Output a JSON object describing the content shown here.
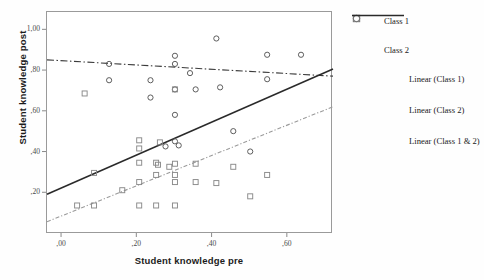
{
  "chart_data": {
    "type": "scatter",
    "title": "",
    "xlabel": "Student knowledge pre",
    "ylabel": "Student knowledge post",
    "xlim": [
      -0.04,
      0.72
    ],
    "ylim": [
      0.0,
      1.09
    ],
    "xticks": [
      ",00",
      ",20",
      ",40",
      ",60"
    ],
    "xtick_values": [
      0.0,
      0.2,
      0.4,
      0.6
    ],
    "yticks": [
      "1,00",
      ",80",
      ",60",
      ",40",
      ",20"
    ],
    "ytick_values": [
      1.0,
      0.8,
      0.6,
      0.4,
      0.2
    ],
    "grid": false,
    "legend_position": "right",
    "series": [
      {
        "name": "Class 1",
        "marker": "circle",
        "color": "#555555",
        "points": [
          [
            0.125,
            0.835
          ],
          [
            0.125,
            0.755
          ],
          [
            0.235,
            0.755
          ],
          [
            0.235,
            0.67
          ],
          [
            0.3,
            0.875
          ],
          [
            0.3,
            0.835
          ],
          [
            0.3,
            0.71
          ],
          [
            0.3,
            0.585
          ],
          [
            0.3,
            0.455
          ],
          [
            0.31,
            0.435
          ],
          [
            0.34,
            0.79
          ],
          [
            0.355,
            0.71
          ],
          [
            0.41,
            0.96
          ],
          [
            0.42,
            0.72
          ],
          [
            0.455,
            0.505
          ],
          [
            0.545,
            0.88
          ],
          [
            0.545,
            0.76
          ],
          [
            0.635,
            0.88
          ],
          [
            0.5,
            0.405
          ],
          [
            0.275,
            0.43
          ]
        ]
      },
      {
        "name": "Class 2",
        "marker": "square",
        "color": "#8a8a8a",
        "points": [
          [
            0.04,
            0.14
          ],
          [
            0.085,
            0.14
          ],
          [
            0.085,
            0.3
          ],
          [
            0.16,
            0.215
          ],
          [
            0.205,
            0.14
          ],
          [
            0.205,
            0.255
          ],
          [
            0.205,
            0.35
          ],
          [
            0.205,
            0.46
          ],
          [
            0.205,
            0.42
          ],
          [
            0.25,
            0.14
          ],
          [
            0.25,
            0.29
          ],
          [
            0.25,
            0.35
          ],
          [
            0.255,
            0.34
          ],
          [
            0.26,
            0.45
          ],
          [
            0.285,
            0.33
          ],
          [
            0.3,
            0.14
          ],
          [
            0.3,
            0.255
          ],
          [
            0.3,
            0.29
          ],
          [
            0.3,
            0.345
          ],
          [
            0.3,
            0.71
          ],
          [
            0.355,
            0.255
          ],
          [
            0.355,
            0.345
          ],
          [
            0.41,
            0.25
          ],
          [
            0.455,
            0.33
          ],
          [
            0.5,
            0.185
          ],
          [
            0.545,
            0.29
          ],
          [
            0.06,
            0.69
          ]
        ]
      }
    ],
    "trendlines": [
      {
        "name": "Linear (Class 1)",
        "style": "dash-dot",
        "color": "#3b3b3b",
        "x_start": -0.04,
        "y_start": 0.855,
        "x_end": 0.72,
        "y_end": 0.775
      },
      {
        "name": "Linear (Class 2)",
        "style": "dotted",
        "color": "#9b9b9b",
        "x_start": -0.04,
        "y_start": 0.06,
        "x_end": 0.72,
        "y_end": 0.625
      },
      {
        "name": "Linear (Class 1 & 2)",
        "style": "solid",
        "color": "#2a2a2a",
        "x_start": -0.04,
        "y_start": 0.195,
        "x_end": 0.72,
        "y_end": 0.81
      }
    ]
  },
  "legend": {
    "items": [
      {
        "label": "Class 1",
        "mark": "circle-marker"
      },
      {
        "label": "Class 2",
        "mark": "square-marker"
      },
      {
        "label": "Linear (Class 1)",
        "mark": "dash-dot-line"
      },
      {
        "label": "Linear (Class 2)",
        "mark": "dotted-line"
      },
      {
        "label": "Linear (Class 1 & 2)",
        "mark": "solid-line"
      }
    ]
  }
}
